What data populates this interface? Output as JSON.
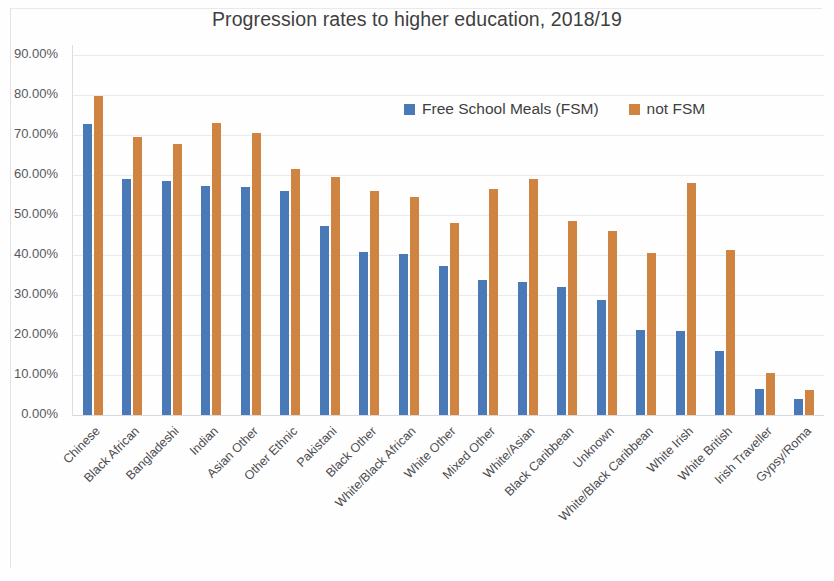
{
  "chart_data": {
    "type": "bar",
    "title": "Progression rates to higher education, 2018/19",
    "xlabel": "",
    "ylabel": "",
    "ylim": [
      0,
      90
    ],
    "ytick_labels": [
      "90.00%",
      "80.00%",
      "70.00%",
      "60.00%",
      "50.00%",
      "40.00%",
      "30.00%",
      "20.00%",
      "10.00%",
      "0.00%"
    ],
    "ytick_values": [
      90,
      80,
      70,
      60,
      50,
      40,
      30,
      20,
      10,
      0
    ],
    "grid": true,
    "legend_position": "upper right (inside plot)",
    "categories": [
      "Chinese",
      "Black African",
      "Bangladeshi",
      "Indian",
      "Asian Other",
      "Other Ethnic",
      "Pakistani",
      "Black Other",
      "White/Black African",
      "White Other",
      "Mixed Other",
      "White/Asian",
      "Black Caribbean",
      "Unknown",
      "White/Black Caribbean",
      "White Irish",
      "White British",
      "Irish Traveller",
      "Gypsy/Roma"
    ],
    "series": [
      {
        "name": "Free School Meals (FSM)",
        "color": "#4a79b8",
        "values": [
          72.8,
          58.9,
          58.6,
          57.3,
          57.1,
          55.9,
          47.2,
          40.8,
          40.2,
          37.3,
          33.8,
          33.3,
          31.9,
          28.8,
          21.2,
          21.0,
          16.1,
          6.6,
          4.0
        ]
      },
      {
        "name": "not FSM",
        "color": "#d08442",
        "values": [
          79.8,
          69.6,
          67.8,
          72.9,
          70.6,
          61.4,
          59.6,
          55.9,
          54.6,
          48.0,
          56.5,
          59.0,
          48.6,
          46.1,
          40.6,
          58.0,
          41.2,
          10.5,
          6.2
        ]
      }
    ]
  },
  "legend": {
    "items": [
      {
        "label": "Free School Meals (FSM)",
        "color": "#4a79b8"
      },
      {
        "label": "not FSM",
        "color": "#d08442"
      }
    ]
  }
}
